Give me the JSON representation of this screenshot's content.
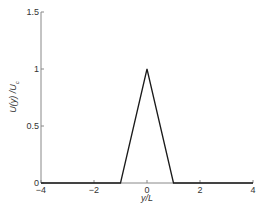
{
  "chart_data": {
    "type": "line",
    "title": "",
    "xlabel": "y/L",
    "ylabel": "U(y) /U_c",
    "ylabel_parts": {
      "main": "U(y) /U",
      "sub": "c"
    },
    "xlim": [
      -4,
      4
    ],
    "ylim": [
      0,
      1.5
    ],
    "xticks": [
      -4,
      -2,
      0,
      2,
      4
    ],
    "xtick_labels": [
      "−4",
      "−2",
      "0",
      "2",
      "4"
    ],
    "yticks": [
      0,
      0.5,
      1,
      1.5
    ],
    "ytick_labels": [
      "0",
      "0.5",
      "1",
      "1.5"
    ],
    "grid": false,
    "legend": null,
    "series": [
      {
        "name": "U(y)/Uc",
        "color": "#1a1a1a",
        "x": [
          -4,
          -1,
          0,
          1,
          4
        ],
        "y": [
          0,
          0,
          1,
          0,
          0
        ]
      }
    ]
  },
  "colors": {
    "axis": "#888888",
    "line": "#1a1a1a",
    "text": "#333333"
  }
}
